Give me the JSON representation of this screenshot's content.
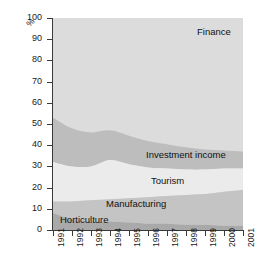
{
  "chart_data": {
    "type": "area",
    "stacked": true,
    "normalized_percent": true,
    "title": "",
    "subtitle": "",
    "xlabel": "",
    "ylabel": "%",
    "ylim": [
      0,
      100
    ],
    "ytick_step": 10,
    "grid": false,
    "legend_position": "inline-on-bands",
    "categories": [
      "1991",
      "1992",
      "1993",
      "1994",
      "1995",
      "1996",
      "1997",
      "1998",
      "1999",
      "2000",
      "2001"
    ],
    "x": [
      1991,
      1992,
      1993,
      1994,
      1995,
      1996,
      1997,
      1998,
      1999,
      2000,
      2001
    ],
    "ytick_labels": [
      "0",
      "10",
      "20",
      "30",
      "40",
      "50",
      "60",
      "70",
      "80",
      "90",
      "100"
    ],
    "ytick_values": [
      0,
      10,
      20,
      30,
      40,
      50,
      60,
      70,
      80,
      90,
      100
    ],
    "series": [
      {
        "name": "Horticulture",
        "color": "#a9a9a9",
        "values": [
          8,
          5,
          4,
          4,
          3.5,
          3,
          3,
          2.5,
          2.5,
          2,
          2
        ],
        "cumulative_top": [
          8,
          5,
          4,
          4,
          3.5,
          3,
          3,
          2.5,
          2.5,
          2,
          2
        ]
      },
      {
        "name": "Manufacturing",
        "color": "#c4c4c4",
        "values": [
          5.5,
          8.5,
          10,
          10.5,
          11.5,
          12.5,
          13,
          14,
          14.5,
          16,
          17
        ],
        "cumulative_top": [
          13.5,
          13.5,
          14,
          14.5,
          15,
          15.5,
          16,
          16.5,
          17,
          18,
          19
        ]
      },
      {
        "name": "Tourism",
        "color": "#ebebeb",
        "values": [
          18.5,
          16.5,
          16,
          18.5,
          16,
          14,
          13,
          12,
          11.5,
          11,
          10
        ],
        "cumulative_top": [
          32,
          30,
          30,
          33,
          31,
          29.5,
          29,
          28.5,
          28.5,
          29,
          29
        ]
      },
      {
        "name": "Investment income",
        "color": "#bdbdbd",
        "values": [
          21,
          18,
          16,
          14,
          13.5,
          12.5,
          11.5,
          10.5,
          9.5,
          8.5,
          8
        ],
        "cumulative_top": [
          53,
          48,
          46,
          47,
          44.5,
          42,
          40.5,
          39,
          38,
          37.5,
          37
        ]
      },
      {
        "name": "Finance",
        "color": "#dcdcdc",
        "values": [
          47,
          52,
          54,
          53,
          55.5,
          58,
          59.5,
          61,
          62,
          62.5,
          63
        ],
        "cumulative_top": [
          100,
          100,
          100,
          100,
          100,
          100,
          100,
          100,
          100,
          100,
          100
        ]
      }
    ],
    "annotations": [
      {
        "name": "Finance",
        "text": "Finance"
      },
      {
        "name": "Investment income",
        "text": "Investment income"
      },
      {
        "name": "Tourism",
        "text": "Tourism"
      },
      {
        "name": "Manufacturing",
        "text": "Manufacturing"
      },
      {
        "name": "Horticulture",
        "text": "Horticulture"
      }
    ]
  },
  "axis": {
    "y_title": "%"
  }
}
